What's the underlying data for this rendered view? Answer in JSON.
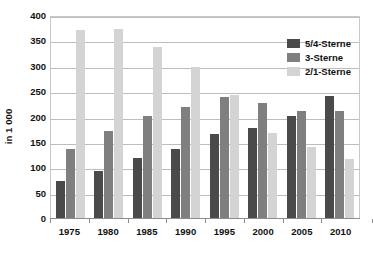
{
  "chart_data": {
    "type": "bar",
    "title": "",
    "xlabel": "",
    "ylabel": "in 1 000",
    "categories": [
      "1975",
      "1980",
      "1985",
      "1990",
      "1995",
      "2000",
      "2005",
      "2010"
    ],
    "series": [
      {
        "name": "5/4-Sterne",
        "color": "#4a4a4a",
        "values": [
          72,
          92,
          118,
          136,
          165,
          177,
          201,
          241
        ]
      },
      {
        "name": "3-Sterne",
        "color": "#7f7f7f",
        "values": [
          136,
          171,
          201,
          219,
          238,
          226,
          211,
          211
        ]
      },
      {
        "name": "2/1-Sterne",
        "color": "#d4d4d4",
        "values": [
          370,
          373,
          336,
          297,
          242,
          168,
          139,
          116
        ]
      }
    ],
    "ylim": [
      0,
      400
    ],
    "yticks": [
      0,
      50,
      100,
      150,
      200,
      250,
      300,
      350,
      400
    ],
    "ytick_labels": [
      "0",
      "50",
      "100",
      "150",
      "200",
      "250",
      "300",
      "350",
      "400"
    ],
    "grid": true,
    "legend_position": "top-right"
  },
  "legend": {
    "items": [
      {
        "label": "5/4-Sterne",
        "color": "#4a4a4a"
      },
      {
        "label": "3-Sterne",
        "color": "#7f7f7f"
      },
      {
        "label": "2/1-Sterne",
        "color": "#d4d4d4"
      }
    ]
  }
}
